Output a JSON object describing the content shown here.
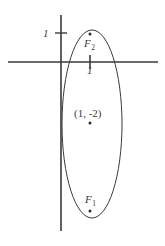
{
  "figure": {
    "type": "ellipse-plot",
    "width": 165,
    "height": 246,
    "background_color": "#ffffff",
    "stroke_color": "#3a3a3a",
    "axis_color": "#3a3a3a"
  },
  "axes": {
    "x_axis": {
      "name": "x-axis",
      "y_pixel": 62,
      "x_start_pixel": 8,
      "x_end_pixel": 158
    },
    "y_axis": {
      "name": "y-axis",
      "x_pixel": 61,
      "y_start_pixel": 15,
      "y_end_pixel": 231
    },
    "origin_pixel": {
      "x": 61,
      "y": 62
    },
    "unit_pixels": 29
  },
  "ticks": [
    {
      "name": "y-tick-1",
      "axis": "y",
      "value": 1,
      "label": "1",
      "tick_x_pixel": 61,
      "tick_y_pixel": 33
    },
    {
      "name": "x-tick-1",
      "axis": "x",
      "value": 1,
      "label": "1",
      "tick_x_pixel": 90,
      "tick_y_pixel": 62
    }
  ],
  "ellipse": {
    "center_label": "(1, -2)",
    "center_pixel": {
      "x": 92,
      "y": 124
    },
    "semi_axis_x_pixel": 30,
    "semi_axis_y_pixel": 94,
    "stroke_width": 1
  },
  "points": [
    {
      "name": "focus-2",
      "label": "F",
      "subscript": "2",
      "dot_pixel": {
        "x": 90,
        "y": 34
      }
    },
    {
      "name": "center-point",
      "label": "(1, -2)",
      "dot_pixel": {
        "x": 90,
        "y": 123
      }
    },
    {
      "name": "focus-1",
      "label": "F",
      "subscript": "1",
      "dot_pixel": {
        "x": 90,
        "y": 211
      }
    }
  ],
  "labels": {
    "y_tick_label": "1",
    "x_tick_label": "1",
    "focus2_base": "F",
    "focus2_sub": "2",
    "focus1_base": "F",
    "focus1_sub": "1",
    "center_text": "(1, -2)"
  },
  "chart_data": {
    "type": "scatter",
    "title": "",
    "xlabel": "",
    "ylabel": "",
    "grid": false,
    "legend": "none",
    "xlim": [
      -1.8,
      3.4
    ],
    "ylim": [
      -5.8,
      1.6
    ],
    "xticks": [
      1
    ],
    "xticklabels": [
      "1"
    ],
    "yticks": [
      1
    ],
    "yticklabels": [
      "1"
    ],
    "shapes": [
      {
        "kind": "ellipse",
        "center": [
          1,
          -2
        ],
        "semi_axis_x": 1,
        "semi_axis_y": 3.25,
        "label": "(1, -2)"
      }
    ],
    "points": [
      {
        "label": "F_2",
        "x": 1,
        "y": 1
      },
      {
        "label": "(1, -2)",
        "x": 1,
        "y": -2
      },
      {
        "label": "F_1",
        "x": 1,
        "y": -5
      }
    ],
    "annotations": [
      "1",
      "1",
      "F_2",
      "(1, -2)",
      "F_1"
    ]
  }
}
